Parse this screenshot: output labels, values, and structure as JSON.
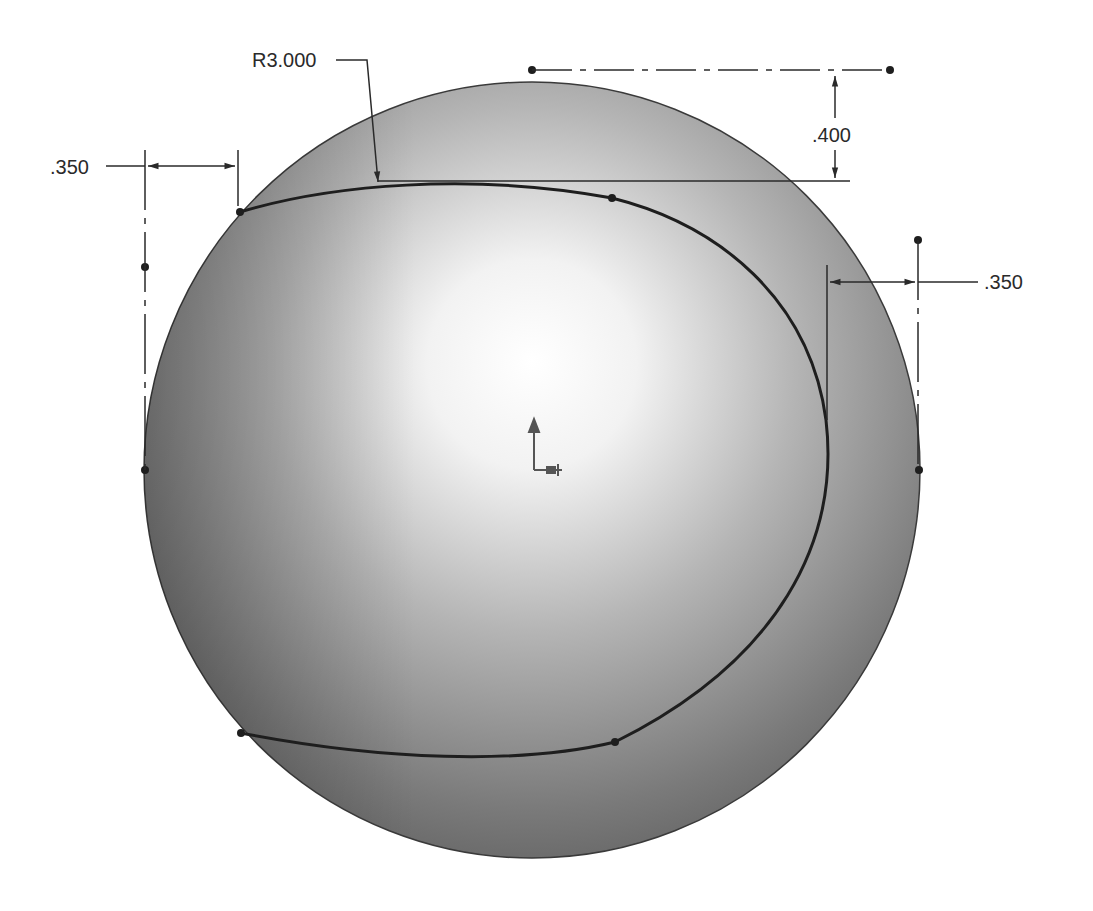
{
  "drawing": {
    "type": "CAD sketch on sphere",
    "dimensions": {
      "radius_label": "R3.000",
      "left_offset_label": ".350",
      "right_offset_label": ".350",
      "top_offset_label": ".400"
    },
    "colors": {
      "sphere_highlight": "#ffffff",
      "sphere_mid": "#b8b8b8",
      "sphere_shadow": "#5e5e5e",
      "curve": "#1e1e1e",
      "dimension": "#2a2a2a"
    },
    "elements": [
      "sphere",
      "closed spline curve",
      "dimension lines",
      "centerlines",
      "origin triad"
    ]
  }
}
